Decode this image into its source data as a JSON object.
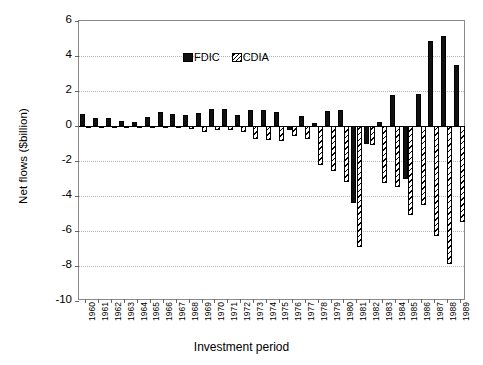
{
  "chart_data": {
    "type": "bar",
    "title": "",
    "xlabel": "Investment period",
    "ylabel": "Net flows ($billion)",
    "ylim": [
      -10,
      6
    ],
    "yticks": [
      6,
      4,
      2,
      0,
      -2,
      -4,
      -6,
      -8,
      -10
    ],
    "ytick_labels": [
      "6",
      "4",
      "2",
      "0",
      "-2",
      "-4",
      "-6",
      "-8",
      "-10"
    ],
    "grid": true,
    "grid_axis": "y",
    "grid_style": "dotted",
    "legend_position": "top-left",
    "categories": [
      "1960",
      "1961",
      "1962",
      "1963",
      "1964",
      "1965",
      "1966",
      "1967",
      "1968",
      "1969",
      "1970",
      "1971",
      "1972",
      "1973",
      "1974",
      "1975",
      "1976",
      "1977",
      "1978",
      "1979",
      "1980",
      "1981",
      "1982",
      "1983",
      "1984",
      "1985",
      "1986",
      "1987",
      "1988",
      "1989"
    ],
    "series": [
      {
        "name": "FDIC",
        "color": "#111111",
        "pattern": "solid",
        "values": [
          0.7,
          0.45,
          0.45,
          0.3,
          0.25,
          0.5,
          0.8,
          0.7,
          0.65,
          0.75,
          0.95,
          0.95,
          0.65,
          0.9,
          0.9,
          0.8,
          -0.25,
          0.55,
          0.15,
          0.85,
          0.9,
          -4.4,
          -1.0,
          0.25,
          1.75,
          -3.05,
          1.85,
          4.85,
          5.15,
          3.5
        ]
      },
      {
        "name": "CDIA",
        "color": "#ffffff",
        "pattern": "diagonal-hatch",
        "values": [
          -0.05,
          -0.05,
          -0.05,
          -0.05,
          -0.05,
          -0.05,
          -0.05,
          -0.1,
          -0.15,
          -0.35,
          -0.25,
          -0.2,
          -0.35,
          -0.75,
          -0.8,
          -0.85,
          -0.55,
          -0.75,
          -2.25,
          -2.55,
          -3.2,
          -6.9,
          -1.1,
          -3.25,
          -3.5,
          -5.1,
          -4.5,
          -6.3,
          -7.9,
          -5.5
        ]
      }
    ]
  },
  "legend": {
    "entries": [
      {
        "label": "FDIC",
        "swatch": "solid-square-icon"
      },
      {
        "label": "CDIA",
        "swatch": "hatched-square-icon"
      }
    ]
  },
  "axes": {
    "y_title": "Net flows ($billion)",
    "x_title": "Investment period"
  }
}
